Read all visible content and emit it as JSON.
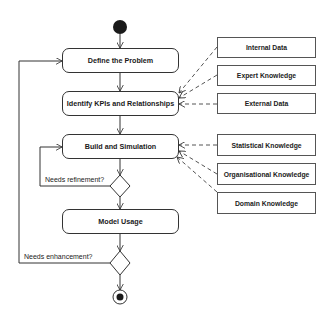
{
  "diagram": {
    "type": "UML activity diagram",
    "activities": [
      {
        "id": "define",
        "label": "Define the Problem"
      },
      {
        "id": "identify",
        "label": "Identify KPIs and Relationships"
      },
      {
        "id": "build",
        "label": "Build and Simulation"
      },
      {
        "id": "usage",
        "label": "Model Usage"
      }
    ],
    "inputs": [
      {
        "label": "Internal Data",
        "target": "identify"
      },
      {
        "label": "Expert Knowledge",
        "target": "identify"
      },
      {
        "label": "External Data",
        "target": "identify"
      },
      {
        "label": "Statistical Knowledge",
        "target": "build"
      },
      {
        "label": "Organisational Knowledge",
        "target": "build"
      },
      {
        "label": "Domain Knowledge",
        "target": "build"
      }
    ],
    "decisions": [
      {
        "guard": "Needs refinement?",
        "loops_to": "build"
      },
      {
        "guard": "Needs enhancement?",
        "loops_to": "define"
      }
    ],
    "nodes": {
      "start": "initial-node",
      "end": "final-node"
    },
    "colors": {
      "line": "#333333",
      "fill": "#ffffff",
      "node": "#1a1a1a"
    }
  }
}
